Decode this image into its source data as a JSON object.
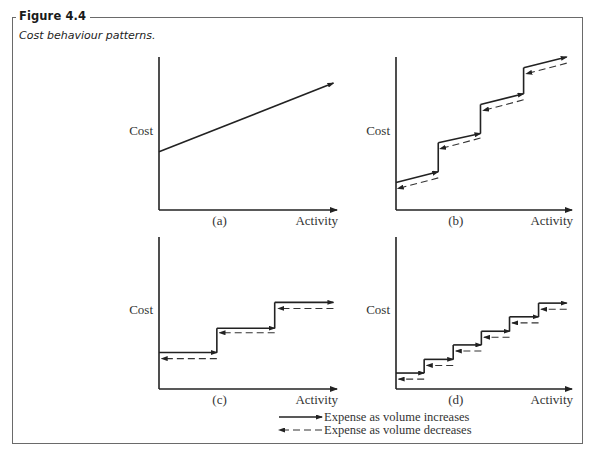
{
  "figure": {
    "label": "Figure 4.4",
    "caption": "Cost behaviour patterns."
  },
  "legend": {
    "increase_label": "Expense as volume increases",
    "decrease_label": "Expense as volume decreases"
  },
  "colors": {
    "ink": "#222222",
    "frame": "#6a6a6a"
  },
  "chart_data": [
    {
      "id": "a",
      "type": "line",
      "panel_label": "(a)",
      "xlabel": "Activity",
      "ylabel": "Cost",
      "xlim": [
        0,
        10
      ],
      "ylim": [
        0,
        10
      ],
      "description": "Semi-variable cost: fixed component plus linear variable component",
      "solid_segments": [
        {
          "x": [
            0,
            9.8
          ],
          "y": [
            3.8,
            8.3
          ]
        }
      ],
      "dashed_segments": []
    },
    {
      "id": "b",
      "type": "line",
      "panel_label": "(b)",
      "xlabel": "Activity",
      "ylabel": "Cost",
      "xlim": [
        0,
        10
      ],
      "ylim": [
        0,
        10
      ],
      "description": "Semi-variable step cost",
      "solid_segments": [
        {
          "x": [
            0,
            2.4
          ],
          "y": [
            1.8,
            2.5
          ]
        },
        {
          "x": [
            2.4,
            4.8
          ],
          "y": [
            4.4,
            5.0
          ]
        },
        {
          "x": [
            4.8,
            7.25
          ],
          "y": [
            6.9,
            7.6
          ]
        },
        {
          "x": [
            7.25,
            9.7
          ],
          "y": [
            9.3,
            10.0
          ]
        }
      ],
      "dashed_segments": [
        {
          "x": [
            2.4,
            0.1
          ],
          "y": [
            2.1,
            1.4
          ]
        },
        {
          "x": [
            4.8,
            2.5
          ],
          "y": [
            4.7,
            4.0
          ]
        },
        {
          "x": [
            7.25,
            4.95
          ],
          "y": [
            7.2,
            6.5
          ]
        },
        {
          "x": [
            9.7,
            7.4
          ],
          "y": [
            9.6,
            8.9
          ]
        }
      ]
    },
    {
      "id": "c",
      "type": "line",
      "panel_label": "(c)",
      "xlabel": "Activity",
      "ylabel": "Cost",
      "xlim": [
        0,
        10
      ],
      "ylim": [
        0,
        10
      ],
      "description": "Step fixed cost",
      "solid_segments": [
        {
          "x": [
            0,
            3.25
          ],
          "y": [
            2.4,
            2.4
          ]
        },
        {
          "x": [
            3.25,
            6.5
          ],
          "y": [
            4.0,
            4.0
          ]
        },
        {
          "x": [
            6.5,
            9.8
          ],
          "y": [
            5.7,
            5.7
          ]
        }
      ],
      "dashed_segments": [
        {
          "x": [
            3.25,
            0.15
          ],
          "y": [
            2.0,
            2.0
          ]
        },
        {
          "x": [
            6.5,
            3.4
          ],
          "y": [
            3.7,
            3.7
          ]
        },
        {
          "x": [
            9.8,
            6.7
          ],
          "y": [
            5.3,
            5.3
          ]
        }
      ]
    },
    {
      "id": "d",
      "type": "line",
      "panel_label": "(d)",
      "xlabel": "Activity",
      "ylabel": "Cost",
      "xlim": [
        0,
        10
      ],
      "ylim": [
        0,
        10
      ],
      "description": "Step variable cost with small steps",
      "solid_segments": [
        {
          "x": [
            0,
            1.6
          ],
          "y": [
            1.05,
            1.05
          ]
        },
        {
          "x": [
            1.6,
            3.25
          ],
          "y": [
            1.95,
            1.95
          ]
        },
        {
          "x": [
            3.25,
            4.85
          ],
          "y": [
            2.9,
            2.9
          ]
        },
        {
          "x": [
            4.85,
            6.45
          ],
          "y": [
            3.8,
            3.8
          ]
        },
        {
          "x": [
            6.45,
            8.1
          ],
          "y": [
            4.75,
            4.75
          ]
        },
        {
          "x": [
            8.1,
            9.7
          ],
          "y": [
            5.65,
            5.65
          ]
        }
      ],
      "dashed_segments": [
        {
          "x": [
            1.6,
            0.15
          ],
          "y": [
            0.65,
            0.65
          ]
        },
        {
          "x": [
            3.25,
            1.75
          ],
          "y": [
            1.55,
            1.55
          ]
        },
        {
          "x": [
            4.85,
            3.4
          ],
          "y": [
            2.5,
            2.5
          ]
        },
        {
          "x": [
            6.45,
            5.0
          ],
          "y": [
            3.4,
            3.4
          ]
        },
        {
          "x": [
            8.1,
            6.6
          ],
          "y": [
            4.35,
            4.35
          ]
        },
        {
          "x": [
            9.7,
            8.25
          ],
          "y": [
            5.25,
            5.25
          ]
        }
      ]
    }
  ]
}
